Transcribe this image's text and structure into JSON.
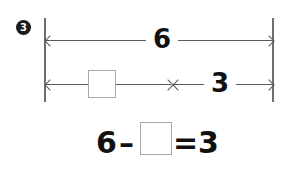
{
  "worksheet": {
    "question_number": "3",
    "bar_model": {
      "total_label": "6",
      "known_part_label": "3",
      "unknown_part_label": "",
      "unknown_part_name": "blank-answer-box"
    },
    "equation": {
      "minuend": "6",
      "minus_sign": "–",
      "unknown_box_label": "",
      "equals_sign": "=",
      "result": "3",
      "full_text": "6 – [ ] = 3"
    },
    "colors": {
      "ink": "#111111",
      "line": "#5a5a5a",
      "end_bar": "#6e6e6e",
      "box_border": "#a8a8a8",
      "background": "#ffffff",
      "badge_fill": "#1a1a1a",
      "badge_text": "#ffffff"
    }
  }
}
